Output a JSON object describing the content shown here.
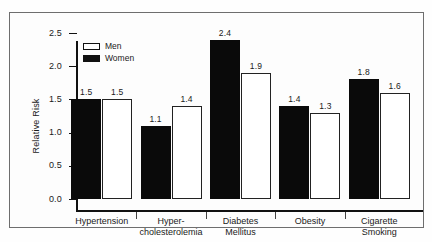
{
  "chart_data": {
    "type": "bar",
    "title": "",
    "xlabel": "",
    "ylabel": "Relative Risk",
    "ylim": [
      0.0,
      2.5
    ],
    "ytick_labels": [
      "0.0",
      "0.5",
      "1.0",
      "1.5",
      "2.0",
      "2.5"
    ],
    "ytick_values": [
      0.0,
      0.5,
      1.0,
      1.5,
      2.0,
      2.5
    ],
    "grid": false,
    "legend_position": "top-left",
    "categories": [
      "Hypertension",
      "Hyper-\ncholesterolemia",
      "Diabetes\nMellitus",
      "Obesity",
      "Cigarette\nSmoking"
    ],
    "category_lines": [
      [
        "Hypertension"
      ],
      [
        "Hyper-",
        "cholesterolemia"
      ],
      [
        "Diabetes",
        "Mellitus"
      ],
      [
        "Obesity"
      ],
      [
        "Cigarette",
        "Smoking"
      ]
    ],
    "series": [
      {
        "name": "Women",
        "color": "#0a0a0a",
        "style": "filled",
        "values": [
          1.5,
          1.1,
          2.4,
          1.4,
          1.8
        ],
        "labels": [
          "1.5",
          "1.1",
          "2.4",
          "1.4",
          "1.8"
        ]
      },
      {
        "name": "Men",
        "color": "#ffffff",
        "style": "open",
        "values": [
          1.5,
          1.4,
          1.9,
          1.3,
          1.6
        ],
        "labels": [
          "1.5",
          "1.4",
          "1.9",
          "1.3",
          "1.6"
        ]
      }
    ]
  },
  "legend": {
    "items": [
      {
        "label": "Men",
        "style": "open"
      },
      {
        "label": "Women",
        "style": "filled"
      }
    ]
  },
  "axis": {
    "y_title": "Relative Risk",
    "ticks": [
      "2.5",
      "2.0",
      "1.5",
      "1.0",
      "0.5",
      "0.0"
    ]
  }
}
